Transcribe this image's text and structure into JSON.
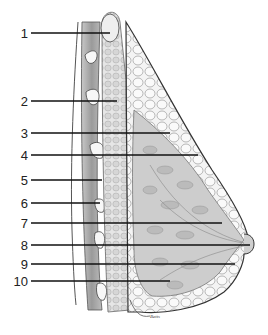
{
  "diagram": {
    "signature": "Betts",
    "labels": [
      {
        "num": "1",
        "y": 33,
        "x_end": 110
      },
      {
        "num": "2",
        "y": 101,
        "x_end": 117
      },
      {
        "num": "3",
        "y": 133,
        "x_end": 170
      },
      {
        "num": "4",
        "y": 155,
        "x_end": 198
      },
      {
        "num": "5",
        "y": 180,
        "x_end": 102
      },
      {
        "num": "6",
        "y": 203,
        "x_end": 100
      },
      {
        "num": "7",
        "y": 223,
        "x_end": 222
      },
      {
        "num": "8",
        "y": 245,
        "x_end": 250
      },
      {
        "num": "9",
        "y": 264,
        "x_end": 235
      },
      {
        "num": "10",
        "y": 281,
        "x_end": 170
      }
    ],
    "colors": {
      "line": "#111111",
      "outline": "#3a3a3a",
      "tissue": "#cfcfcf",
      "muscle": "#a8a8a8",
      "fat": "#f2f2f2",
      "background": "#ffffff"
    }
  }
}
